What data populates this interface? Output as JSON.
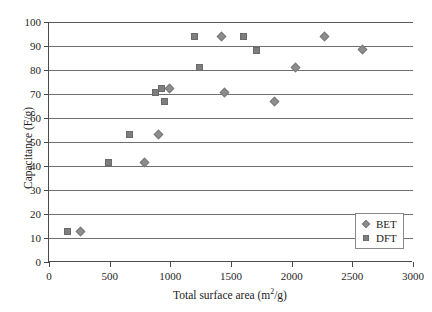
{
  "chart_data": {
    "type": "scatter",
    "title": "",
    "xlabel": "Total surface area (m2/g)",
    "xlabel_base": "Total surface area (m",
    "xlabel_sup": "2",
    "xlabel_tail": "/g)",
    "ylabel": "Capacitance (F/g)",
    "xlim": [
      0,
      3000
    ],
    "ylim": [
      0,
      100
    ],
    "xticks": [
      0,
      500,
      1000,
      1500,
      2000,
      2500,
      3000
    ],
    "yticks": [
      0,
      10,
      20,
      30,
      40,
      50,
      60,
      70,
      80,
      90,
      100
    ],
    "grid": "horizontal",
    "legend_position": "bottom-right",
    "marker_color": "#808080",
    "series": [
      {
        "name": "BET",
        "marker": "diamond",
        "color": "#8d8d8d",
        "points": [
          {
            "x": 260,
            "y": 12.7
          },
          {
            "x": 790,
            "y": 41.5
          },
          {
            "x": 905,
            "y": 53.2
          },
          {
            "x": 990,
            "y": 72.5
          },
          {
            "x": 1420,
            "y": 94.0
          },
          {
            "x": 1450,
            "y": 70.8
          },
          {
            "x": 1860,
            "y": 67.0
          },
          {
            "x": 2030,
            "y": 81.2
          },
          {
            "x": 2270,
            "y": 94.0
          },
          {
            "x": 2580,
            "y": 88.5
          }
        ]
      },
      {
        "name": "DFT",
        "marker": "square",
        "color": "#7e7e7e",
        "points": [
          {
            "x": 150,
            "y": 12.7
          },
          {
            "x": 490,
            "y": 41.5
          },
          {
            "x": 665,
            "y": 53.2
          },
          {
            "x": 880,
            "y": 70.8
          },
          {
            "x": 925,
            "y": 72.5
          },
          {
            "x": 950,
            "y": 66.8
          },
          {
            "x": 1200,
            "y": 94.0
          },
          {
            "x": 1240,
            "y": 81.0
          },
          {
            "x": 1600,
            "y": 94.0
          },
          {
            "x": 1710,
            "y": 88.0
          }
        ]
      }
    ]
  },
  "legend": {
    "entries": [
      {
        "label": "BET",
        "marker": "diamond"
      },
      {
        "label": "DFT",
        "marker": "square"
      }
    ]
  }
}
